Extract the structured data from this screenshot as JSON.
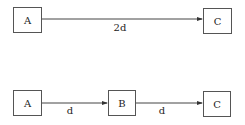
{
  "diagram": {
    "top_row": {
      "nodes": [
        {
          "id": "A",
          "label": "A"
        },
        {
          "id": "C",
          "label": "C"
        }
      ],
      "edges": [
        {
          "from": "A",
          "to": "C",
          "label": "2d"
        }
      ]
    },
    "bottom_row": {
      "nodes": [
        {
          "id": "A",
          "label": "A"
        },
        {
          "id": "B",
          "label": "B"
        },
        {
          "id": "C",
          "label": "C"
        }
      ],
      "edges": [
        {
          "from": "A",
          "to": "B",
          "label": "d"
        },
        {
          "from": "B",
          "to": "C",
          "label": "d"
        }
      ]
    },
    "colors": {
      "stroke": "#555555",
      "text": "#222222",
      "background": "#ffffff"
    }
  }
}
